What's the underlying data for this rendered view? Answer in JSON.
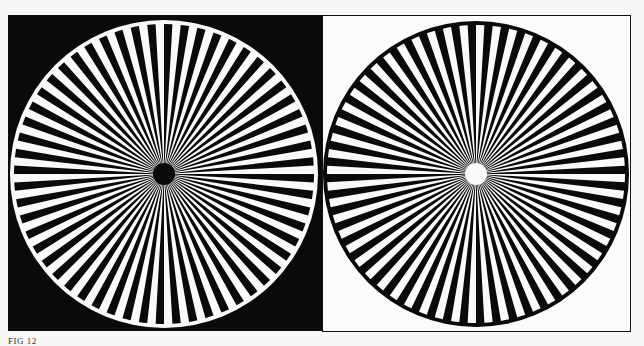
{
  "figure": {
    "caption": "FIG 12",
    "left_star": {
      "center": [
        164,
        174
      ],
      "radius": 154,
      "spokes": 56,
      "background": "#0a0a0a",
      "disc_color": "#fafafa",
      "spoke_color": "#0a0a0a",
      "ring_color": "#fafafa",
      "center_dot_color": "#0a0a0a"
    },
    "right_star": {
      "center": [
        476,
        174
      ],
      "radius": 153,
      "spokes": 56,
      "background": "#fbfbfb",
      "disc_color": "#0a0a0a",
      "spoke_color": "#fafafa",
      "ring_color": "#0a0a0a",
      "center_dot_color": "#fafafa"
    }
  }
}
